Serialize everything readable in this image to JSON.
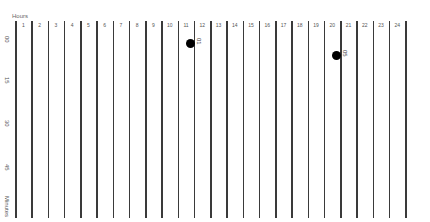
{
  "chart_data": {
    "type": "scatter",
    "title": "",
    "xlabel": "Hours",
    "ylabel": "Minutes",
    "x_ticks": [
      "1",
      "2",
      "3",
      "4",
      "5",
      "6",
      "7",
      "8",
      "9",
      "10",
      "11",
      "12",
      "13",
      "14",
      "15",
      "16",
      "17",
      "18",
      "19",
      "20",
      "21",
      "22",
      "23",
      "24"
    ],
    "y_ticks": [
      "00",
      "15",
      "30",
      "45"
    ],
    "xlim": [
      0,
      24
    ],
    "ylim": [
      0,
      60
    ],
    "grid": "vertical lines at each hour boundary",
    "points": [
      {
        "hour": 11,
        "minute": 1,
        "label": "01"
      },
      {
        "hour": 20,
        "minute": 5,
        "label": "05"
      }
    ]
  },
  "labels": {
    "hours": "Hours",
    "minutes": "Minutes"
  },
  "colors": {
    "line": "#3a3a3a",
    "dot": "#000000",
    "text": "#555555"
  }
}
